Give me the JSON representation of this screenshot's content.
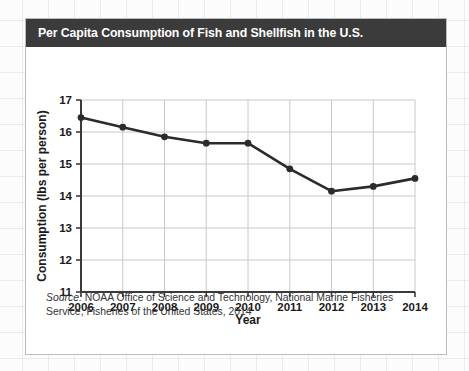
{
  "card": {
    "title": "Per Capita Consumption of Fish and Shellfish in the U.S.",
    "title_bar_color": "#3b3b3b",
    "title_text_color": "#ffffff",
    "border_color": "#b9bcbf",
    "background_color": "#ffffff"
  },
  "source": {
    "label": "Source:",
    "text": " NOAA Office of Science and Technology, National Marine Fisheries Service, Fisheries of the United States, 2014"
  },
  "chart_data": {
    "type": "line",
    "title": "Per Capita Consumption of Fish and Shellfish in the U.S.",
    "xlabel": "Year",
    "ylabel": "Consumption (lbs per person)",
    "categories": [
      "2006",
      "2007",
      "2008",
      "2009",
      "2010",
      "2011",
      "2012",
      "2013",
      "2014"
    ],
    "x": [
      2006,
      2007,
      2008,
      2009,
      2010,
      2011,
      2012,
      2013,
      2014
    ],
    "values": [
      16.45,
      16.15,
      15.85,
      15.65,
      15.65,
      14.85,
      14.15,
      14.3,
      14.55
    ],
    "series": [
      {
        "name": "Per capita consumption",
        "values": [
          16.45,
          16.15,
          15.85,
          15.65,
          15.65,
          14.85,
          14.15,
          14.3,
          14.55
        ]
      }
    ],
    "ylim": [
      11,
      17
    ],
    "yticks": [
      11,
      12,
      13,
      14,
      15,
      16,
      17
    ],
    "ytick_labels": [
      "11",
      "12",
      "13",
      "14",
      "15",
      "16",
      "17"
    ],
    "xlim": [
      2006,
      2014
    ],
    "xticks": [
      2006,
      2007,
      2008,
      2009,
      2010,
      2011,
      2012,
      2013,
      2014
    ],
    "grid": true,
    "grid_color": "#c8c8c8",
    "legend": "none",
    "line_color": "#2b2b2b",
    "marker": "circle",
    "marker_color": "#2b2b2b",
    "axis_color": "#3a3a3a"
  }
}
